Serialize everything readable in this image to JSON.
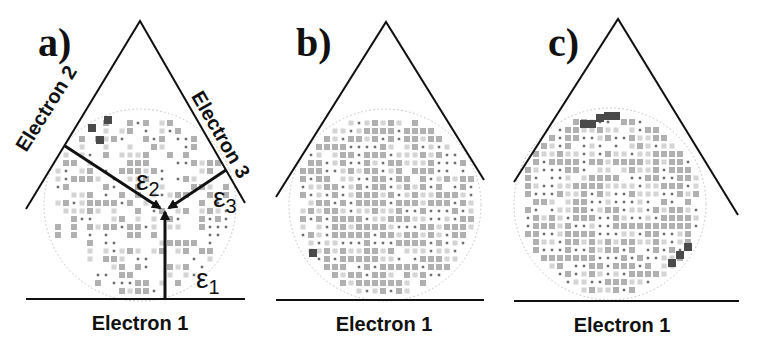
{
  "figure": {
    "colors": {
      "line": "#111111",
      "circle": "#bdbdbd",
      "cell_light": "#d4d4d4",
      "cell_mid": "#b0b0b0",
      "cell_dark": "#6e6e6e",
      "cell_darkest": "#4a4a4a"
    },
    "panels": [
      {
        "id": "a",
        "label": "a)",
        "label_pos": [
          38,
          56
        ],
        "apex": [
          140,
          21
        ],
        "left_end": [
          26,
          209
        ],
        "right_end": [
          245,
          203
        ],
        "baseline": [
          [
            26,
            299
          ],
          [
            245,
            299
          ]
        ],
        "circle": {
          "cx": 140,
          "cy": 205,
          "r": 96
        },
        "density": 0.55,
        "seed": 7,
        "hotspots": [
          [
            92,
            128
          ],
          [
            100,
            140
          ],
          [
            108,
            120
          ]
        ],
        "axis_labels": [
          {
            "text": "Electron 1",
            "x": 140,
            "y": 330,
            "rotate": 0
          },
          {
            "text": "Electron 2",
            "x": 52,
            "y": 112,
            "rotate": -58
          },
          {
            "text": "Electron 3",
            "x": 215,
            "y": 138,
            "rotate": 60
          }
        ],
        "arrows": [
          {
            "name": "epsilon-1-arrow",
            "from": [
              165,
              299
            ],
            "to": [
              165,
              212
            ]
          },
          {
            "name": "epsilon-2-arrow",
            "from": [
              65,
              146
            ],
            "to": [
              160,
              208
            ]
          },
          {
            "name": "epsilon-3-arrow",
            "from": [
              226,
              170
            ],
            "to": [
              169,
              208
            ]
          }
        ],
        "epsilons": [
          {
            "symbol": "ε",
            "sub": "1",
            "x": 196,
            "y": 288
          },
          {
            "symbol": "ε",
            "sub": "2",
            "x": 136,
            "y": 190
          },
          {
            "symbol": "ε",
            "sub": "3",
            "x": 213,
            "y": 207
          }
        ]
      },
      {
        "id": "b",
        "label": "b)",
        "label_pos": [
          296,
          56
        ],
        "apex": [
          386,
          22
        ],
        "left_end": [
          276,
          197
        ],
        "right_end": [
          484,
          180
        ],
        "baseline": [
          [
            276,
            300
          ],
          [
            484,
            300
          ]
        ],
        "circle": {
          "cx": 385,
          "cy": 205,
          "r": 96
        },
        "density": 0.97,
        "seed": 13,
        "hotspots": [
          [
            313,
            253
          ]
        ],
        "axis_labels": [
          {
            "text": "Electron 1",
            "x": 384,
            "y": 331,
            "rotate": 0
          }
        ],
        "arrows": [],
        "epsilons": []
      },
      {
        "id": "c",
        "label": "c)",
        "label_pos": [
          548,
          56
        ],
        "apex": [
          618,
          19
        ],
        "left_end": [
          514,
          182
        ],
        "right_end": [
          738,
          215
        ],
        "baseline": [
          [
            514,
            301
          ],
          [
            739,
            301
          ]
        ],
        "circle": {
          "cx": 610,
          "cy": 204,
          "r": 96
        },
        "density": 0.95,
        "seed": 29,
        "hotspots": [
          [
            608,
            116
          ],
          [
            616,
            116
          ],
          [
            600,
            118
          ],
          [
            592,
            124
          ],
          [
            584,
            124
          ],
          [
            680,
            255
          ],
          [
            688,
            247
          ],
          [
            672,
            263
          ]
        ],
        "axis_labels": [
          {
            "text": "Electron 1",
            "x": 622,
            "y": 332,
            "rotate": 0
          }
        ],
        "arrows": [],
        "epsilons": []
      }
    ]
  }
}
